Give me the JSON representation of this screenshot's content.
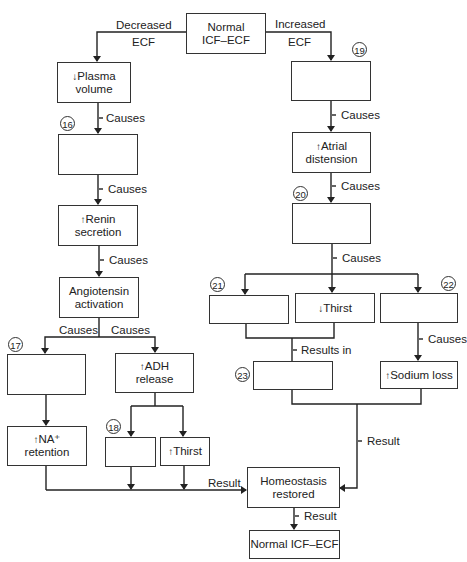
{
  "diagram": {
    "type": "flowchart",
    "start": {
      "label": "Normal ICF–ECF",
      "line1": "Normal",
      "line2": "ICF–ECF"
    },
    "branches": {
      "left": {
        "line1": "Decreased",
        "line2": "ECF"
      },
      "right": {
        "line1": "Increased",
        "line2": "ECF"
      }
    },
    "left_path": {
      "plasma": {
        "arrow": "↓",
        "line1": "Plasma",
        "line2": "volume"
      },
      "box16": {
        "number": "16",
        "text": ""
      },
      "renin": {
        "arrow": "↑",
        "line1": "Renin",
        "line2": "secretion"
      },
      "angiotensin": {
        "line1": "Angiotensin",
        "line2": "activation"
      },
      "box17": {
        "number": "17",
        "text": ""
      },
      "adh": {
        "arrow": "↑",
        "line1": "ADH",
        "line2": "release"
      },
      "na": {
        "arrow": "↑",
        "line1": "NA⁺",
        "line2": "retention"
      },
      "box18": {
        "number": "18",
        "text": ""
      },
      "thirst_up": {
        "arrow": "↑",
        "text": "Thirst"
      }
    },
    "right_path": {
      "box19": {
        "number": "19",
        "text": ""
      },
      "atrial": {
        "arrow": "↑",
        "line1": "Atrial",
        "line2": "distension"
      },
      "box20": {
        "number": "20",
        "text": ""
      },
      "box21": {
        "number": "21",
        "text": ""
      },
      "thirst_down": {
        "arrow": "↓",
        "text": "Thirst"
      },
      "box22": {
        "number": "22",
        "text": ""
      },
      "box23": {
        "number": "23",
        "text": ""
      },
      "sodium": {
        "arrow": "↑",
        "text": "Sodium loss"
      }
    },
    "homeostasis": {
      "line1": "Homeostasis",
      "line2": "restored"
    },
    "end": {
      "label": "Normal ICF–ECF"
    },
    "edge_labels": {
      "causes": "Causes",
      "results_in": "Results in",
      "result": "Result"
    }
  }
}
